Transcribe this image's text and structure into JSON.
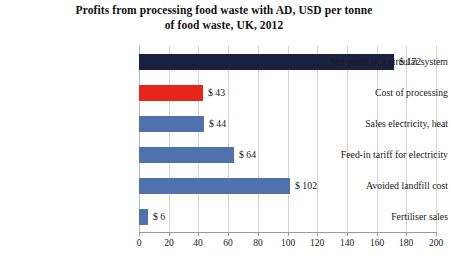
{
  "chart_data": {
    "type": "bar",
    "orientation": "horizontal",
    "title": "Profits from processing food waste with AD, USD per tonne of food waste, UK, 2012",
    "title_line1": "Profits from processing food waste with AD, USD per tonne",
    "title_line2": "of food waste, UK, 2012",
    "xlabel": "",
    "ylabel": "",
    "xlim": [
      0,
      200
    ],
    "xticks": [
      0,
      20,
      40,
      60,
      80,
      100,
      120,
      140,
      160,
      180,
      200
    ],
    "xtick_labels": [
      "0",
      "20",
      "40",
      "60",
      "80",
      "100",
      "120",
      "140",
      "160",
      "180",
      "200"
    ],
    "grid": true,
    "grid_axis": "x",
    "legend": false,
    "categories": [
      "Net profit in a circular system",
      "Cost of processing",
      "Sales electricity, heat",
      "Feed-in tariff for electricity",
      "Avoided landfill cost",
      "Fertiliser sales"
    ],
    "values": [
      172,
      43,
      44,
      64,
      102,
      6
    ],
    "data_labels": [
      "$ 172",
      "$ 43",
      "$ 44",
      "$ 64",
      "$ 102",
      "$ 6"
    ],
    "bar_colors": [
      "#1a2040",
      "#e8251a",
      "#4f71ad",
      "#4f71ad",
      "#4f71ad",
      "#4f71ad"
    ],
    "bars": [
      {
        "category": "Net profit in a circular system",
        "value": 172,
        "label": "$ 172",
        "color": "#1a2040"
      },
      {
        "category": "Cost of processing",
        "value": 43,
        "label": "$ 43",
        "color": "#e8251a"
      },
      {
        "category": "Sales electricity, heat",
        "value": 44,
        "label": "$ 44",
        "color": "#4f71ad"
      },
      {
        "category": "Feed-in tariff for electricity",
        "value": 64,
        "label": "$ 64",
        "color": "#4f71ad"
      },
      {
        "category": "Avoided landfill cost",
        "value": 102,
        "label": "$ 102",
        "color": "#4f71ad"
      },
      {
        "category": "Fertiliser sales",
        "value": 6,
        "label": "$ 6",
        "color": "#4f71ad"
      }
    ],
    "colors": {
      "navy": "#1a2040",
      "red": "#e8251a",
      "blue": "#4f71ad",
      "gridline": "#d4d4d4",
      "axis": "#9a9a9a",
      "text": "#1a1a1a",
      "background": "#ffffff"
    }
  }
}
